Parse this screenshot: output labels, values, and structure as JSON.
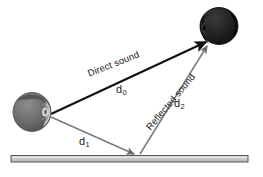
{
  "figure": {
    "background_color": "#ffffff"
  },
  "labels": {
    "direct_sound": "Direct sound",
    "reflected_sound": "Reflected sound",
    "d0_base": "d",
    "d0_sub": "0",
    "d1_base": "d",
    "d1_sub": "1",
    "d2_base": "d",
    "d2_sub": "2"
  },
  "objects": {
    "source_head": "sound-source-head",
    "listener_head": "listener-head",
    "floor": "reflecting-surface"
  },
  "colors": {
    "direct_ray": "#111111",
    "reflected_ray": "#7a7a7a",
    "incident_ray": "#7a7a7a",
    "floor_fill": "#c8c8c8",
    "floor_border": "#555555",
    "source_head": "#6e6e6e",
    "listener_head": "#1c1c1c",
    "text": "#1a1a1a"
  },
  "geometry": {
    "source_point": [
      50,
      115
    ],
    "listener_point": [
      209,
      43
    ],
    "reflection_point": [
      136,
      156
    ],
    "floor_left": [
      11,
      156
    ],
    "floor_right": [
      248,
      156
    ]
  }
}
